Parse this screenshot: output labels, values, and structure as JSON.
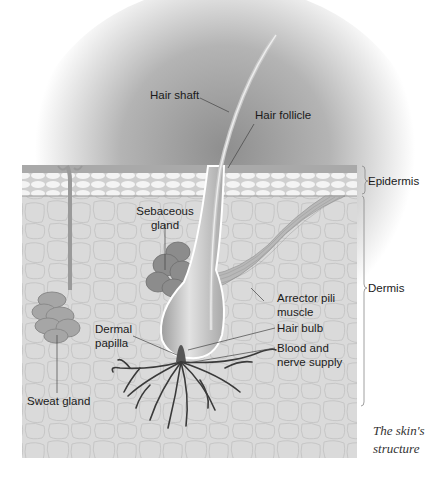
{
  "title": "The skin's structure",
  "caption": {
    "line1": "The skin's",
    "line2": "structure"
  },
  "layers": {
    "epidermis": "Epidermis",
    "dermis": "Dermis"
  },
  "labels": {
    "hair_shaft": "Hair shaft",
    "hair_follicle": "Hair follicle",
    "sebaceous_line1": "Sebaceous",
    "sebaceous_line2": "gland",
    "arrector_line1": "Arrector pili",
    "arrector_line2": "muscle",
    "dermal_line1": "Dermal",
    "dermal_line2": "papilla",
    "hair_bulb": "Hair bulb",
    "blood_line1": "Blood and",
    "blood_line2": "nerve supply",
    "sweat_gland": "Sweat gland"
  },
  "colors": {
    "halo": "#9a9a9a",
    "epidermis_top": "#a8a8a8",
    "epidermis_cells": "#efefef",
    "dermis": "#d9d9d9",
    "gland": "#8a8a8a",
    "vessels": "#3a3a3a"
  }
}
